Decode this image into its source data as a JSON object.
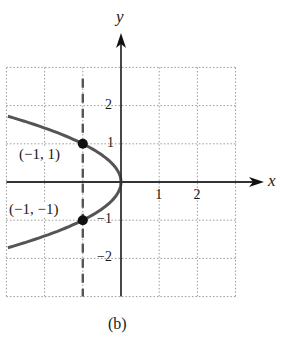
{
  "chart_data": {
    "type": "line",
    "title": "",
    "caption": "(b)",
    "xlabel": "x",
    "ylabel": "y",
    "xlim": [
      -3,
      3
    ],
    "ylim": [
      -3,
      3
    ],
    "grid": true,
    "grid_style": "dotted",
    "x_ticks": [
      {
        "value": 1,
        "label": "1"
      },
      {
        "value": 2,
        "label": "2"
      }
    ],
    "y_ticks": [
      {
        "value": 2,
        "label": "2"
      },
      {
        "value": 1,
        "label": "1"
      },
      {
        "value": -1,
        "label": "−1"
      },
      {
        "value": -2,
        "label": "−2"
      }
    ],
    "series": [
      {
        "name": "parabola x = -y^2",
        "equation": "x = -y^2",
        "color": "#555555",
        "points": [
          {
            "x": -2.96,
            "y": 1.72
          },
          {
            "x": -2.25,
            "y": 1.5
          },
          {
            "x": -1.0,
            "y": 1.0
          },
          {
            "x": -0.25,
            "y": 0.5
          },
          {
            "x": 0,
            "y": 0
          },
          {
            "x": -0.25,
            "y": -0.5
          },
          {
            "x": -1.0,
            "y": -1.0
          },
          {
            "x": -2.25,
            "y": -1.5
          },
          {
            "x": -2.96,
            "y": -1.72
          }
        ]
      }
    ],
    "vertical_lines": [
      {
        "x": -1,
        "style": "dashed",
        "color": "#555555"
      }
    ],
    "marked_points": [
      {
        "x": -1,
        "y": 1,
        "label": "(−1, 1)"
      },
      {
        "x": -1,
        "y": -1,
        "label": "(−1, −1)"
      }
    ]
  }
}
